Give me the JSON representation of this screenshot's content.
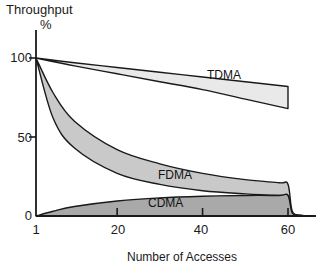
{
  "chart_data": {
    "type": "area",
    "title": "",
    "ylabel": "Throughput",
    "ylabel_unit": "%",
    "xlabel": "Number of Accesses",
    "xlim": [
      1,
      70
    ],
    "ylim": [
      0,
      105
    ],
    "xticks": [
      1,
      20,
      40,
      60
    ],
    "xticklabels": [
      "1",
      "20",
      "40",
      "60"
    ],
    "yticks": [
      0,
      50,
      100
    ],
    "yticklabels": [
      "0",
      "50",
      "100"
    ],
    "grid": false,
    "legend": "inline-band-labels",
    "series": [
      {
        "name": "TDMA",
        "label": "TDMA",
        "fill": "#e9e9e9",
        "stroke": "#1a1a1a",
        "upper": [
          {
            "x": 1,
            "y": 100
          },
          {
            "x": 10,
            "y": 97
          },
          {
            "x": 20,
            "y": 94
          },
          {
            "x": 30,
            "y": 91
          },
          {
            "x": 40,
            "y": 88
          },
          {
            "x": 50,
            "y": 85
          },
          {
            "x": 60,
            "y": 82
          }
        ],
        "lower": [
          {
            "x": 1,
            "y": 100
          },
          {
            "x": 10,
            "y": 95
          },
          {
            "x": 20,
            "y": 90
          },
          {
            "x": 30,
            "y": 85
          },
          {
            "x": 40,
            "y": 80
          },
          {
            "x": 50,
            "y": 74
          },
          {
            "x": 60,
            "y": 68
          }
        ]
      },
      {
        "name": "FDMA",
        "label": "FDMA",
        "fill": "#c9c9c9",
        "stroke": "#1a1a1a",
        "upper": [
          {
            "x": 1,
            "y": 100
          },
          {
            "x": 5,
            "y": 78
          },
          {
            "x": 10,
            "y": 60
          },
          {
            "x": 20,
            "y": 42
          },
          {
            "x": 30,
            "y": 33
          },
          {
            "x": 40,
            "y": 27
          },
          {
            "x": 50,
            "y": 23
          },
          {
            "x": 58,
            "y": 21
          },
          {
            "x": 60,
            "y": 20
          },
          {
            "x": 61,
            "y": 3
          },
          {
            "x": 63,
            "y": 0.5
          },
          {
            "x": 66,
            "y": 0
          }
        ],
        "lower": [
          {
            "x": 1,
            "y": 100
          },
          {
            "x": 5,
            "y": 62
          },
          {
            "x": 10,
            "y": 43
          },
          {
            "x": 20,
            "y": 27
          },
          {
            "x": 30,
            "y": 20
          },
          {
            "x": 40,
            "y": 16
          },
          {
            "x": 50,
            "y": 14
          },
          {
            "x": 58,
            "y": 13
          },
          {
            "x": 60,
            "y": 13
          },
          {
            "x": 61,
            "y": 2
          },
          {
            "x": 63,
            "y": 0.3
          },
          {
            "x": 66,
            "y": 0
          }
        ]
      },
      {
        "name": "CDMA",
        "label": "CDMA",
        "fill": "#a9a9a9",
        "stroke": "#1a1a1a",
        "upper": [
          {
            "x": 1,
            "y": 0
          },
          {
            "x": 5,
            "y": 3
          },
          {
            "x": 10,
            "y": 6
          },
          {
            "x": 20,
            "y": 9.5
          },
          {
            "x": 30,
            "y": 11.5
          },
          {
            "x": 40,
            "y": 12.5
          },
          {
            "x": 50,
            "y": 13
          },
          {
            "x": 58,
            "y": 13
          },
          {
            "x": 60,
            "y": 13
          },
          {
            "x": 61,
            "y": 2
          },
          {
            "x": 63,
            "y": 0.3
          },
          {
            "x": 66,
            "y": 0
          }
        ],
        "lower": [
          {
            "x": 1,
            "y": 0
          },
          {
            "x": 66,
            "y": 0
          }
        ]
      }
    ]
  },
  "axes": {
    "y_title_line1": "Throughput",
    "y_title_line2": "%",
    "x_title": "Number of Accesses",
    "y_tick_100": "100",
    "y_tick_50": "50",
    "y_tick_0": "0",
    "x_tick_1": "1",
    "x_tick_20": "20",
    "x_tick_40": "40",
    "x_tick_60": "60"
  },
  "band_labels": {
    "tdma": "TDMA",
    "fdma": "FDMA",
    "cdma": "CDMA"
  },
  "colors": {
    "axis": "#1a1a1a",
    "tdma_fill": "#e9e9e9",
    "fdma_fill": "#c9c9c9",
    "cdma_fill": "#a9a9a9",
    "background": "#ffffff"
  }
}
